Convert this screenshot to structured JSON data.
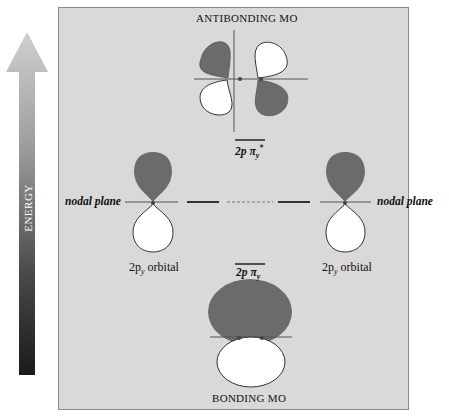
{
  "diagram": {
    "axis": {
      "label": "ENERGY",
      "direction": "up"
    },
    "titles": {
      "antibonding": "ANTIBONDING MO",
      "bonding": "BONDING MO"
    },
    "levels": {
      "antibonding": {
        "main": "2p π",
        "sub": "y",
        "sup": "*"
      },
      "bonding": {
        "main": "2p π",
        "sub": "y"
      }
    },
    "atomic_orbitals": [
      {
        "side": "left",
        "main": "2p",
        "sub": "y",
        "suffix": " orbital",
        "plane_label": "nodal plane"
      },
      {
        "side": "right",
        "main": "2p",
        "sub": "y",
        "suffix": " orbital",
        "plane_label": "nodal plane"
      }
    ],
    "colors": {
      "panel": "#d9d9d9",
      "lobe_dark": "#6b6b6b",
      "lobe_light": "#ffffff",
      "line": "#333333"
    }
  }
}
